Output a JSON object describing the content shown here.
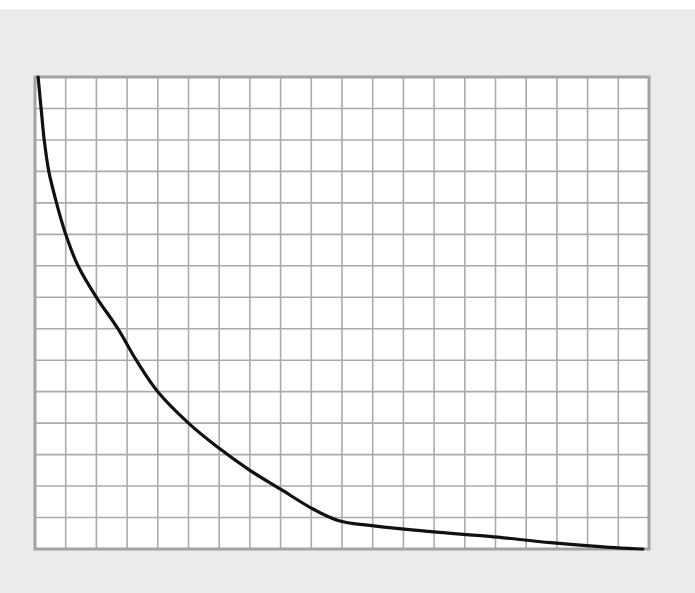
{
  "colors": {
    "page_background": "#ebebea",
    "top_band": "#ffffff",
    "plot_background": "#ffffff",
    "grid_line": "#ababab",
    "border": "#a3a3a3",
    "curve": "#111111"
  },
  "chart_data": {
    "type": "line",
    "title": "",
    "xlabel": "",
    "ylabel": "",
    "x_tick_labels": [],
    "y_tick_labels": [],
    "legend": [],
    "grid": true,
    "grid_columns": 20,
    "grid_rows": 15,
    "xlim": [
      0,
      20
    ],
    "ylim": [
      0,
      15
    ],
    "plot_box_px": {
      "left": 35,
      "top": 77,
      "right": 649,
      "bottom": 549
    },
    "series": [
      {
        "name": "curve",
        "x": [
          0.1,
          0.2,
          0.3,
          0.45,
          0.7,
          1.0,
          1.4,
          2.0,
          2.7,
          3.3,
          4.0,
          5.0,
          6.0,
          7.0,
          8.0,
          9.0,
          9.9,
          10.9,
          12.9,
          14.8,
          16.8,
          18.7,
          19.8
        ],
        "y": [
          15.0,
          14.0,
          13.0,
          12.0,
          11.0,
          10.0,
          9.0,
          8.0,
          7.0,
          6.0,
          5.0,
          4.0,
          3.2,
          2.5,
          1.9,
          1.3,
          0.9,
          0.75,
          0.55,
          0.4,
          0.2,
          0.05,
          0.0
        ]
      }
    ]
  }
}
